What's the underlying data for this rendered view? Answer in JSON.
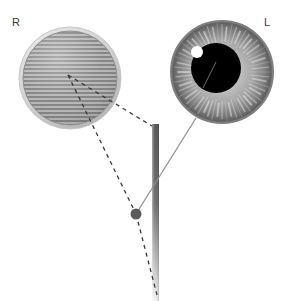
{
  "figure": {
    "background_color": "#ffffff",
    "width": 284,
    "height": 301
  },
  "labels": {
    "right_eye": "R",
    "left_eye": "L"
  },
  "right_eye": {
    "name": "occluded-striped-eye",
    "center_x": 70,
    "center_y": 78,
    "radius": 52,
    "ring_color": "#d8d8d8",
    "fill_color": "#9e9e9e",
    "stripe_color": "#7c7c7c",
    "stripe_light_color": "#c2c2c2",
    "stripe_spacing": 4,
    "pattern": "horizontal-stripes"
  },
  "left_eye": {
    "name": "iris-eye",
    "center_x": 222,
    "center_y": 72,
    "radius": 52,
    "limbus_color": "#6b6b6b",
    "iris_outer_color": "#8a8a8a",
    "iris_inner_color": "#cfcfcf",
    "striation_color": "#e4e4e4",
    "striation_count": 60,
    "pupil": {
      "center_x": 216,
      "center_y": 68,
      "radius": 25,
      "color": "#000000"
    },
    "highlight": {
      "center_x": 197,
      "center_y": 52,
      "radius": 6,
      "color": "#ffffff"
    }
  },
  "pole": {
    "name": "vertical-fixation-rod",
    "x": 155,
    "top_y": 124,
    "bottom_y": 300,
    "width": 6,
    "top_color": "#5a5a5a",
    "bottom_color": "#f2f2f2"
  },
  "target_dot": {
    "name": "fixation-target-dot",
    "center_x": 136,
    "center_y": 214,
    "radius": 5,
    "color": "#5a5a5a"
  },
  "sight_line": {
    "name": "left-eye-visual-axis",
    "from_x": 136,
    "from_y": 214,
    "to_x": 196,
    "to_y": 118,
    "color": "#8a8a8a",
    "width": 1.3,
    "style": "solid"
  },
  "pupil_line": {
    "name": "pupil-axis-marker",
    "from_x": 203,
    "from_y": 88,
    "to_x": 216,
    "to_y": 62,
    "color": "#6e6e6e",
    "width": 1
  },
  "dashed_lines": {
    "color": "#3a3a3a",
    "width": 1.3,
    "dash": "4 4",
    "vertex_x": 68,
    "vertex_y": 75,
    "segments": [
      {
        "name": "dashed-line-to-pole",
        "from_x": 68,
        "from_y": 75,
        "to_x": 152,
        "to_y": 126
      },
      {
        "name": "dashed-line-to-target",
        "from_x": 68,
        "from_y": 75,
        "to_x": 136,
        "to_y": 214
      },
      {
        "name": "dashed-line-past-target",
        "from_x": 136,
        "from_y": 214,
        "to_x": 157,
        "to_y": 295
      }
    ]
  }
}
